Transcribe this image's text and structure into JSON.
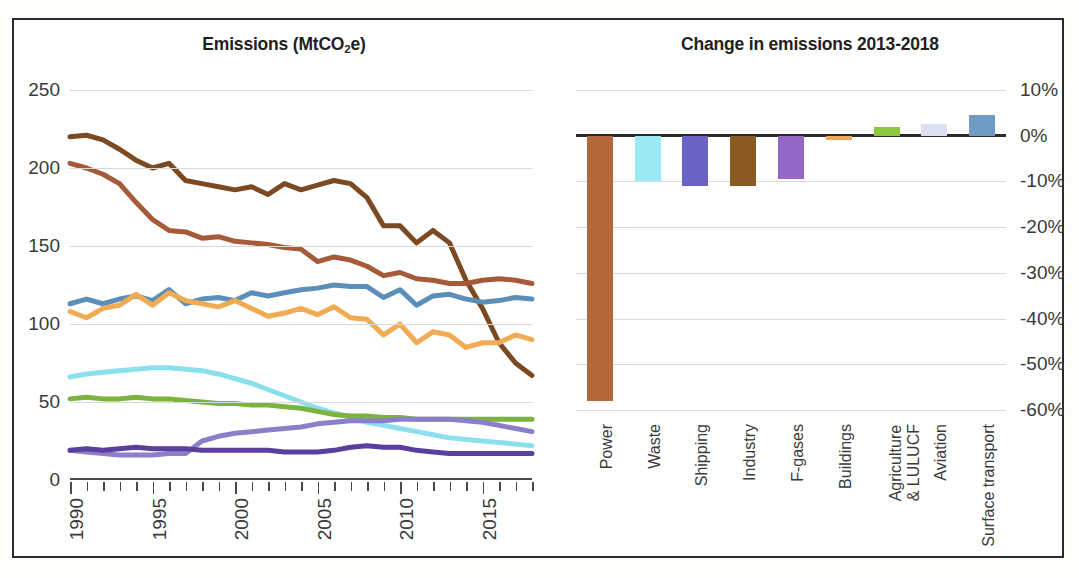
{
  "figure": {
    "frame_color": "#2b2b2b",
    "background": "#ffffff"
  },
  "left_panel": {
    "title_main": "Emissions (MtCO",
    "title_sub": "2",
    "title_tail": "e)"
  },
  "right_panel": {
    "title": "Change in emissions 2013-2018"
  },
  "chart_data": [
    {
      "type": "line",
      "title": "Emissions (MtCO2e)",
      "xlabel": "",
      "ylabel": "MtCO2e",
      "xlim": [
        1990,
        2018
      ],
      "ylim": [
        0,
        250
      ],
      "yticks": [
        0,
        50,
        100,
        150,
        200,
        250
      ],
      "ytick_labels": [
        "0",
        "50",
        "100",
        "150",
        "200",
        "250"
      ],
      "xticks": [
        1990,
        1995,
        2000,
        2005,
        2010,
        2015
      ],
      "xtick_labels": [
        "1990",
        "1995",
        "2000",
        "2005",
        "2010",
        "2015"
      ],
      "grid": true,
      "legend": "none",
      "x": [
        1990,
        1991,
        1992,
        1993,
        1994,
        1995,
        1996,
        1997,
        1998,
        1999,
        2000,
        2001,
        2002,
        2003,
        2004,
        2005,
        2006,
        2007,
        2008,
        2009,
        2010,
        2011,
        2012,
        2013,
        2014,
        2015,
        2016,
        2017,
        2018
      ],
      "series": [
        {
          "name": "Power",
          "color": "#7b4a23",
          "values": [
            220,
            221,
            218,
            212,
            205,
            200,
            203,
            192,
            190,
            188,
            186,
            188,
            183,
            190,
            186,
            189,
            192,
            190,
            181,
            163,
            163,
            152,
            160,
            152,
            128,
            110,
            88,
            75,
            67
          ]
        },
        {
          "name": "Surface transport",
          "color": "#a65a3a",
          "values": [
            203,
            200,
            196,
            190,
            178,
            167,
            160,
            159,
            155,
            156,
            153,
            152,
            151,
            149,
            148,
            140,
            143,
            141,
            137,
            131,
            133,
            129,
            128,
            126,
            126,
            128,
            129,
            128,
            126
          ]
        },
        {
          "name": "Buildings",
          "color": "#5b8fb9",
          "values": [
            113,
            116,
            113,
            116,
            118,
            115,
            122,
            113,
            116,
            117,
            115,
            120,
            118,
            120,
            122,
            123,
            125,
            124,
            124,
            117,
            122,
            112,
            118,
            119,
            116,
            114,
            115,
            117,
            116
          ]
        },
        {
          "name": "Industry",
          "color": "#f0ab53",
          "values": [
            108,
            104,
            110,
            112,
            119,
            112,
            120,
            115,
            113,
            111,
            115,
            110,
            105,
            107,
            110,
            106,
            111,
            104,
            103,
            93,
            100,
            88,
            95,
            93,
            85,
            88,
            88,
            93,
            90
          ]
        },
        {
          "name": "Waste",
          "color": "#8ce0ee",
          "values": [
            66,
            68,
            69,
            70,
            71,
            72,
            72,
            71,
            70,
            68,
            65,
            62,
            58,
            54,
            50,
            46,
            43,
            40,
            37,
            35,
            33,
            31,
            29,
            27,
            26,
            25,
            24,
            23,
            22
          ]
        },
        {
          "name": "Agriculture & LULUCF",
          "color": "#7cb33f",
          "values": [
            52,
            53,
            52,
            52,
            53,
            52,
            52,
            51,
            50,
            49,
            49,
            48,
            48,
            47,
            46,
            44,
            42,
            41,
            41,
            40,
            40,
            39,
            39,
            39,
            39,
            39,
            39,
            39,
            39
          ]
        },
        {
          "name": "F-gases",
          "color": "#8c7fc9",
          "values": [
            19,
            18,
            17,
            16,
            16,
            16,
            17,
            17,
            25,
            28,
            30,
            31,
            32,
            33,
            34,
            36,
            37,
            38,
            38,
            38,
            39,
            39,
            39,
            39,
            38,
            37,
            35,
            33,
            31
          ]
        },
        {
          "name": "Shipping",
          "color": "#5b3f9e",
          "values": [
            19,
            20,
            19,
            20,
            21,
            20,
            20,
            20,
            19,
            19,
            19,
            19,
            19,
            18,
            18,
            18,
            19,
            21,
            22,
            21,
            21,
            19,
            18,
            17,
            17,
            17,
            17,
            17,
            17
          ]
        }
      ]
    },
    {
      "type": "bar",
      "title": "Change in emissions 2013-2018",
      "xlabel": "",
      "ylabel": "",
      "ylim": [
        -60,
        10
      ],
      "yticks": [
        10,
        0,
        -10,
        -20,
        -30,
        -40,
        -50,
        -60
      ],
      "ytick_labels": [
        "10%",
        "0%",
        "-10%",
        "-20%",
        "-30%",
        "-40%",
        "-50%",
        "-60%"
      ],
      "grid": true,
      "legend": "none",
      "categories": [
        "Power",
        "Waste",
        "Shipping",
        "Industry",
        "F-gases",
        "Buildings",
        "Agriculture & LULUCF",
        "Aviation",
        "Surface transport"
      ],
      "category_lines": [
        [
          "Power"
        ],
        [
          "Waste"
        ],
        [
          "Shipping"
        ],
        [
          "Industry"
        ],
        [
          "F-gases"
        ],
        [
          "Buildings"
        ],
        [
          "Agriculture",
          "& LULUCF"
        ],
        [
          "Aviation"
        ],
        [
          "Surface transport"
        ]
      ],
      "values": [
        -58,
        -10,
        -11,
        -11,
        -9.5,
        -1,
        2,
        2.5,
        4.5
      ],
      "colors": [
        "#b5673c",
        "#9be9f2",
        "#6a62c4",
        "#8a5a22",
        "#9268c4",
        "#f0a85a",
        "#8fc council",
        "#dde0f2",
        "#6e9cc4"
      ],
      "bar_colors": [
        "#b5673c",
        "#9be9f2",
        "#6a62c4",
        "#8a5a22",
        "#9268c4",
        "#f0a85a",
        "#8fc63f",
        "#dde0f2",
        "#6e9cc4"
      ]
    }
  ]
}
